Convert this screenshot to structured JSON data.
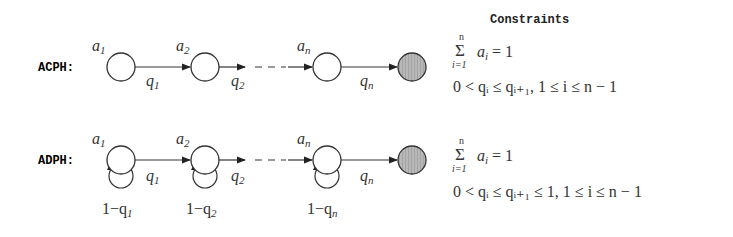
{
  "constraints_title": "Constraints",
  "rows": [
    {
      "label": "ACPH:",
      "type": "continuous",
      "initial_probs": [
        "a",
        "a",
        "a"
      ],
      "initial_subs": [
        "1",
        "2",
        "n"
      ],
      "rates": [
        "q",
        "q",
        "q"
      ],
      "rate_subs": [
        "1",
        "2",
        "n"
      ],
      "self_loops": false,
      "constraint_sum": {
        "sigma_top": "n",
        "sigma_bottom": "i=1",
        "body": "a",
        "body_sub": "i",
        "rhs": " = 1"
      },
      "constraint_order": "0 < qᵢ ≤ qᵢ₊₁,  1 ≤ i ≤ n − 1"
    },
    {
      "label": "ADPH:",
      "type": "discrete",
      "initial_probs": [
        "a",
        "a",
        "a"
      ],
      "initial_subs": [
        "1",
        "2",
        "n"
      ],
      "rates": [
        "q",
        "q",
        "q"
      ],
      "rate_subs": [
        "1",
        "2",
        "n"
      ],
      "self_loops": true,
      "loop_labels": [
        "1−q",
        "1−q",
        "1−q"
      ],
      "loop_subs": [
        "1",
        "2",
        "n"
      ],
      "constraint_sum": {
        "sigma_top": "n",
        "sigma_bottom": "i=1",
        "body": "a",
        "body_sub": "i",
        "rhs": " = 1"
      },
      "constraint_order": "0 < qᵢ ≤ qᵢ₊₁ ≤ 1,  1 ≤ i ≤ n − 1"
    }
  ],
  "colors": {
    "stroke": "#333333",
    "absorbing_fill": "#b5b5b5"
  }
}
